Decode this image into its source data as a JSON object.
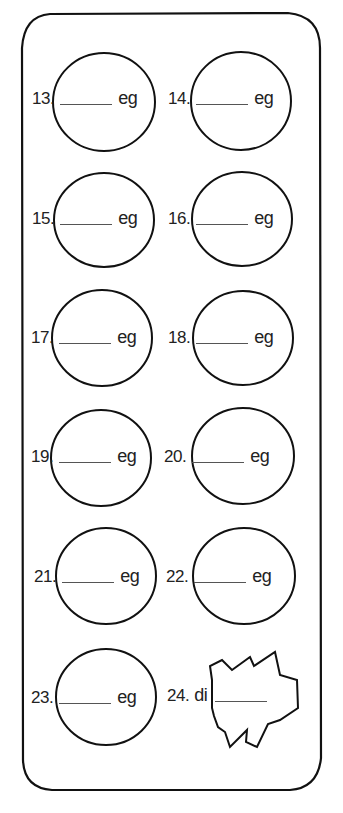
{
  "worksheet": {
    "items": [
      {
        "number": "13.",
        "prefix": "",
        "suffix": "eg"
      },
      {
        "number": "14.",
        "prefix": "",
        "suffix": "eg"
      },
      {
        "number": "15.",
        "prefix": "",
        "suffix": "eg"
      },
      {
        "number": "16.",
        "prefix": "",
        "suffix": "eg"
      },
      {
        "number": "17.",
        "prefix": "",
        "suffix": "eg"
      },
      {
        "number": "18.",
        "prefix": "",
        "suffix": "eg"
      },
      {
        "number": "19.",
        "prefix": "",
        "suffix": "eg"
      },
      {
        "number": "20.",
        "prefix": "",
        "suffix": "eg"
      },
      {
        "number": "21.",
        "prefix": "",
        "suffix": "eg"
      },
      {
        "number": "22.",
        "prefix": "",
        "suffix": "eg"
      },
      {
        "number": "23.",
        "prefix": "",
        "suffix": "eg"
      },
      {
        "number": "24.",
        "prefix": "di",
        "suffix": ""
      }
    ]
  }
}
